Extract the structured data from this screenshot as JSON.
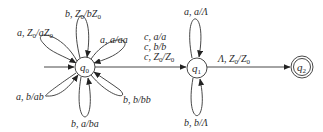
{
  "diagram": {
    "type": "pushdown-automaton",
    "states": [
      {
        "id": "q0",
        "label": "q",
        "sub": "0",
        "initial": true,
        "accepting": false
      },
      {
        "id": "q1",
        "label": "q",
        "sub": "1",
        "initial": false,
        "accepting": false
      },
      {
        "id": "q2",
        "label": "q",
        "sub": "2",
        "initial": false,
        "accepting": true
      }
    ],
    "transitions": {
      "q0_loop_top": {
        "from": "q0",
        "to": "q0",
        "label": "b, Z0/bZ0"
      },
      "q0_loop_upper_left": {
        "from": "q0",
        "to": "q0",
        "label": "a, Z0/aZ0"
      },
      "q0_loop_upper_right": {
        "from": "q0",
        "to": "q0",
        "label": "a, a/aa"
      },
      "q0_loop_lower_left": {
        "from": "q0",
        "to": "q0",
        "label": "a, b/ab"
      },
      "q0_loop_bottom": {
        "from": "q0",
        "to": "q0",
        "label": "b, a/ba"
      },
      "q0_loop_lower_right": {
        "from": "q0",
        "to": "q0",
        "label": "b, b/bb"
      },
      "q0_to_q1": {
        "from": "q0",
        "to": "q1",
        "labels": [
          "c, a/a",
          "c, b/b",
          "c, Z0/Z0"
        ]
      },
      "q1_loop_top": {
        "from": "q1",
        "to": "q1",
        "label": "a, a/Λ"
      },
      "q1_loop_bottom": {
        "from": "q1",
        "to": "q1",
        "label": "b, b/Λ"
      },
      "q1_to_q2": {
        "from": "q1",
        "to": "q2",
        "label": "Λ, Z0/Z0"
      }
    }
  }
}
